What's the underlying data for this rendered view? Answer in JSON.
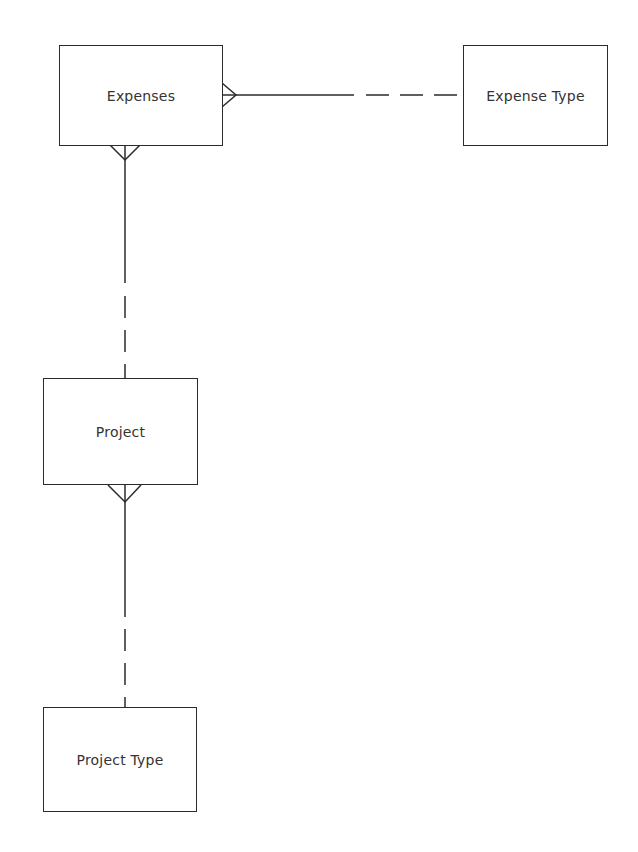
{
  "diagram": {
    "type": "entity-relationship",
    "entities": [
      {
        "id": "expenses",
        "label": "Expenses",
        "x": 59,
        "y": 45,
        "w": 164,
        "h": 101
      },
      {
        "id": "expense_type",
        "label": "Expense Type",
        "x": 463,
        "y": 45,
        "w": 145,
        "h": 101
      },
      {
        "id": "project",
        "label": "Project",
        "x": 43,
        "y": 378,
        "w": 155,
        "h": 107
      },
      {
        "id": "project_type",
        "label": "Project Type",
        "x": 43,
        "y": 707,
        "w": 154,
        "h": 105
      }
    ],
    "relationships": [
      {
        "from": "expenses",
        "to": "expense_type",
        "from_cardinality": "many",
        "to_cardinality": "one",
        "from_optionality": "mandatory",
        "to_optionality": "optional"
      },
      {
        "from": "expenses",
        "to": "project",
        "from_cardinality": "many",
        "to_cardinality": "one",
        "from_optionality": "mandatory",
        "to_optionality": "optional"
      },
      {
        "from": "project",
        "to": "project_type",
        "from_cardinality": "many",
        "to_cardinality": "one",
        "from_optionality": "mandatory",
        "to_optionality": "optional"
      }
    ]
  },
  "labels": {
    "expenses": "Expenses",
    "expense_type": "Expense Type",
    "project": "Project",
    "project_type": "Project Type"
  }
}
